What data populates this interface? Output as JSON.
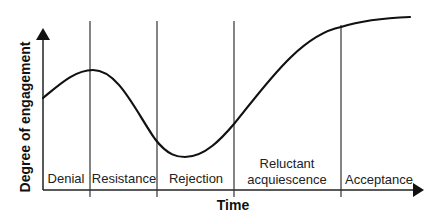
{
  "diagram": {
    "type": "change-curve",
    "x_axis": {
      "label": "Time"
    },
    "y_axis": {
      "label": "Degree of engagement"
    },
    "stages": [
      {
        "label": "Denial",
        "lines": [
          "Denial"
        ]
      },
      {
        "label": "Resistance",
        "lines": [
          "Resistance"
        ]
      },
      {
        "label": "Rejection",
        "lines": [
          "Rejection"
        ]
      },
      {
        "label": "Reluctant acquiescence",
        "lines": [
          "Reluctant",
          "acquiescence"
        ]
      },
      {
        "label": "Acceptance",
        "lines": [
          "Acceptance"
        ]
      }
    ],
    "curve_description": "Engagement rises slightly during Denial, peaks at start of Resistance, falls to a minimum during Rejection, then rises steeply through Reluctant acquiescence and plateaus at a high level during Acceptance.",
    "colors": {
      "line": "#111111",
      "background": "#ffffff"
    }
  }
}
